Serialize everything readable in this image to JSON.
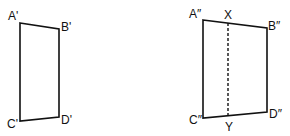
{
  "figures": [
    {
      "name": "left-quadrilateral",
      "vertices": {
        "A": {
          "label": "A'",
          "x": 20,
          "y": 23
        },
        "B": {
          "label": "B'",
          "x": 59,
          "y": 29
        },
        "C": {
          "label": "C'",
          "x": 20,
          "y": 121
        },
        "D": {
          "label": "D'",
          "x": 59,
          "y": 117
        }
      }
    },
    {
      "name": "right-quadrilateral",
      "vertices": {
        "A": {
          "label": "A″",
          "x": 203,
          "y": 20
        },
        "B": {
          "label": "B″",
          "x": 267,
          "y": 28
        },
        "C": {
          "label": "C″",
          "x": 203,
          "y": 118
        },
        "D": {
          "label": "D″",
          "x": 267,
          "y": 112
        }
      },
      "dashed_line": {
        "top_label": "X",
        "bottom_label": "Y"
      }
    }
  ],
  "colors": {
    "stroke": "#111111",
    "background": "#ffffff"
  }
}
